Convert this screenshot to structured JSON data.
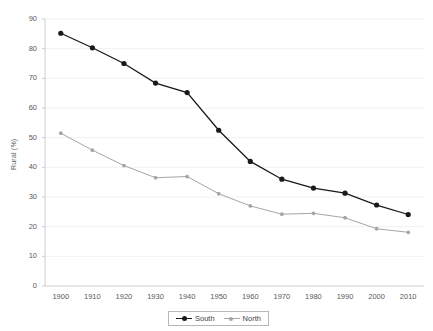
{
  "chart_data": {
    "type": "line",
    "title": "",
    "xlabel": "",
    "ylabel": "Rural (%)",
    "categories": [
      "1900",
      "1910",
      "1920",
      "1930",
      "1940",
      "1950",
      "1960",
      "1970",
      "1980",
      "1990",
      "2000",
      "2010"
    ],
    "series": [
      {
        "name": "South",
        "color": "#1a1a1a",
        "marker": "filled-circle",
        "values": [
          85.2,
          80.3,
          75.0,
          68.4,
          65.2,
          52.5,
          42.0,
          36.0,
          33.0,
          31.3,
          27.3,
          24.1
        ]
      },
      {
        "name": "North",
        "color": "#a6a6a6",
        "marker": "filled-circle",
        "values": [
          51.5,
          45.8,
          40.6,
          36.5,
          36.9,
          31.1,
          27.0,
          24.2,
          24.5,
          23.0,
          19.3,
          18.1
        ]
      }
    ],
    "ylim": [
      0,
      90
    ],
    "yticks": [
      0,
      10,
      20,
      30,
      40,
      50,
      60,
      70,
      80,
      90
    ],
    "grid": "horizontal",
    "legend_position": "bottom"
  },
  "legend": {
    "items": [
      {
        "label": "South"
      },
      {
        "label": "North"
      }
    ]
  }
}
